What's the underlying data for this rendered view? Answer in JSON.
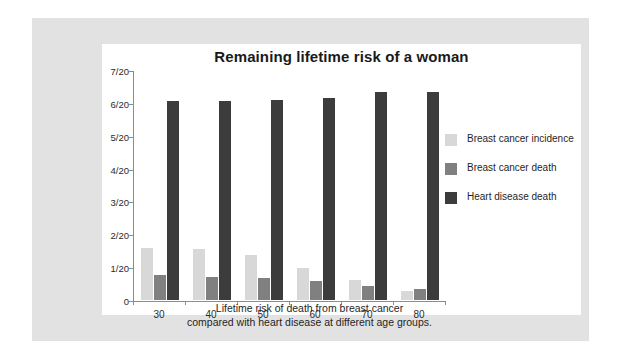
{
  "chart_data": {
    "type": "bar",
    "title": "Remaining lifetime risk of a woman",
    "caption_line1": "Lifetime risk of death from breast cancer",
    "caption_line2": "compared with heart disease at different age groups.",
    "xlabel": "",
    "ylabel": "",
    "grid": false,
    "legend_position": "right",
    "ylim": [
      0,
      0.35
    ],
    "categories": [
      "30",
      "40",
      "50",
      "60",
      "70",
      "80"
    ],
    "ytick_values": [
      0,
      0.05,
      0.1,
      0.15,
      0.2,
      0.25,
      0.3,
      0.35
    ],
    "ytick_labels": [
      "0",
      "1/20",
      "2/20",
      "3/20",
      "4/20",
      "5/20",
      "6/20",
      "7/20"
    ],
    "series": [
      {
        "name": "Breast cancer incidence",
        "color": "#d8d8d8",
        "values": [
          0.079,
          0.078,
          0.068,
          0.049,
          0.03,
          0.013
        ]
      },
      {
        "name": "Breast cancer death",
        "color": "#808080",
        "values": [
          0.038,
          0.035,
          0.034,
          0.029,
          0.022,
          0.017
        ]
      },
      {
        "name": "Heart disease death",
        "color": "#3c3c3c",
        "values": [
          0.303,
          0.303,
          0.304,
          0.308,
          0.316,
          0.316
        ]
      }
    ]
  },
  "colors": {
    "mat": "#e2e2e2",
    "panel": "#ffffff",
    "axis": "#8c8c8c",
    "text": "#1f1f1f"
  }
}
